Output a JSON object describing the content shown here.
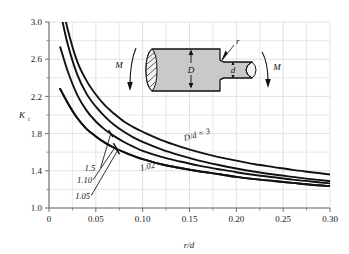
{
  "chart_data": {
    "type": "line",
    "title": "",
    "xlabel": "r/d",
    "ylabel": "K t",
    "ylabel_main": "K",
    "ylabel_sub": "t",
    "xlim": [
      0,
      0.3
    ],
    "ylim": [
      1.0,
      3.0
    ],
    "grid": true,
    "legend_position": "inline-annotations",
    "xticks": [
      "0",
      "0.05",
      "0.10",
      "0.15",
      "0.20",
      "0.25",
      "0.30"
    ],
    "xtick_values": [
      0,
      0.05,
      0.1,
      0.15,
      0.2,
      0.25,
      0.3
    ],
    "yticks": [
      "1.0",
      "1.4",
      "1.8",
      "2.2",
      "2.6",
      "3.0"
    ],
    "ytick_values": [
      1.0,
      1.4,
      1.8,
      2.2,
      2.6,
      3.0
    ],
    "x": [
      0.012,
      0.02,
      0.03,
      0.04,
      0.05,
      0.06,
      0.07,
      0.08,
      0.09,
      0.1,
      0.12,
      0.14,
      0.16,
      0.18,
      0.2,
      0.22,
      0.24,
      0.26,
      0.28,
      0.3
    ],
    "series": [
      {
        "name": "D/d = 3",
        "label": "D/d = 3",
        "label_x": 0.145,
        "label_y": 1.72,
        "label_rotation": -17,
        "values": [
          3.3,
          2.92,
          2.58,
          2.37,
          2.22,
          2.1,
          2.01,
          1.93,
          1.87,
          1.82,
          1.73,
          1.66,
          1.6,
          1.55,
          1.51,
          1.47,
          1.44,
          1.41,
          1.385,
          1.36
        ]
      },
      {
        "name": "D/d = 1.5",
        "label": "1.5",
        "label_x": 0.038,
        "label_y": 1.4,
        "leader_to_x": 0.066,
        "leader_to_y": 1.8,
        "values": [
          3.12,
          2.76,
          2.44,
          2.23,
          2.09,
          1.98,
          1.89,
          1.82,
          1.76,
          1.71,
          1.63,
          1.565,
          1.51,
          1.465,
          1.425,
          1.39,
          1.36,
          1.335,
          1.31,
          1.29
        ]
      },
      {
        "name": "D/d = 1.10",
        "label": "1.10",
        "label_x": 0.03,
        "label_y": 1.27,
        "leader_to_x": 0.071,
        "leader_to_y": 1.66,
        "values": [
          2.73,
          2.47,
          2.22,
          2.05,
          1.93,
          1.84,
          1.77,
          1.71,
          1.66,
          1.615,
          1.55,
          1.5,
          1.455,
          1.42,
          1.385,
          1.355,
          1.33,
          1.305,
          1.285,
          1.265
        ]
      },
      {
        "name": "D/d = 1.05",
        "label": "1.05",
        "label_x": 0.028,
        "label_y": 1.1,
        "leader_to_x": 0.073,
        "leader_to_y": 1.615,
        "values": [
          2.28,
          2.13,
          1.97,
          1.85,
          1.77,
          1.7,
          1.645,
          1.6,
          1.56,
          1.525,
          1.47,
          1.43,
          1.395,
          1.365,
          1.335,
          1.31,
          1.29,
          1.27,
          1.25,
          1.235
        ]
      },
      {
        "name": "D/d = 1.02",
        "label": "1.02",
        "label_x": 0.098,
        "label_y": 1.4,
        "label_rotation": -13,
        "values": [
          2.28,
          2.13,
          1.97,
          1.85,
          1.77,
          1.7,
          1.645,
          1.6,
          1.56,
          1.525,
          1.47,
          1.43,
          1.395,
          1.365,
          1.335,
          1.31,
          1.29,
          1.27,
          1.25,
          1.235
        ]
      }
    ]
  },
  "inset": {
    "name": "stepped-round-shaft-in-bending",
    "labels": {
      "big_diameter": "D",
      "small_diameter": "d",
      "fillet_radius": "r",
      "moment_left": "M",
      "moment_right": "M"
    }
  },
  "colors": {
    "grid": "#d4d4d4",
    "axis": "#6e6e6e",
    "curve": "#111111",
    "text": "#1a1a1a",
    "inset_fill": "#c9c9c9",
    "inset_stroke": "#111111",
    "background": "#ffffff"
  }
}
